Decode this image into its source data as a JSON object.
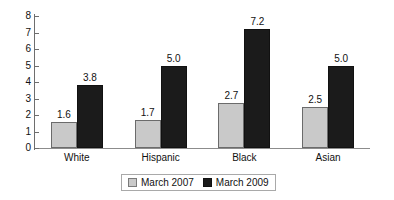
{
  "chart_data": {
    "type": "bar",
    "title": "",
    "subtitle": "",
    "xlabel": "",
    "ylabel": "",
    "categories": [
      "White",
      "Hispanic",
      "Black",
      "Asian"
    ],
    "series": [
      {
        "name": "March 2007",
        "color": "#c9c9c9",
        "values": [
          1.6,
          1.7,
          2.7,
          2.5
        ]
      },
      {
        "name": "March 2009",
        "color": "#1b1b1b",
        "values": [
          3.8,
          5.0,
          7.2,
          5.0
        ]
      }
    ],
    "value_labels": [
      [
        "1.6",
        "3.8"
      ],
      [
        "1.7",
        "5.0"
      ],
      [
        "2.7",
        "7.2"
      ],
      [
        "2.5",
        "5.0"
      ]
    ],
    "ylim": [
      0,
      8
    ],
    "yticks": [
      0,
      1,
      2,
      3,
      4,
      5,
      6,
      7,
      8
    ],
    "ytick_labels": [
      "0",
      "1",
      "2",
      "3",
      "4",
      "5",
      "6",
      "7",
      "8"
    ],
    "grid": false,
    "legend_position": "bottom"
  },
  "legend": {
    "items": [
      {
        "label": "March 2007",
        "swatch": "gray-swatch"
      },
      {
        "label": "March 2009",
        "swatch": "black-swatch"
      }
    ]
  }
}
